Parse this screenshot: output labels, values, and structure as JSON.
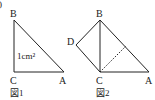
{
  "figures": [
    {
      "caption": "図1",
      "vertices": {
        "B": "B",
        "C": "C",
        "A": "A"
      },
      "area_label": "1cm²"
    },
    {
      "caption": "図2",
      "vertices": {
        "B": "B",
        "C": "C",
        "A": "A",
        "D": "D"
      }
    }
  ],
  "stray_mark": ")",
  "colors": {
    "line": "#222222",
    "background": "#ffffff"
  }
}
